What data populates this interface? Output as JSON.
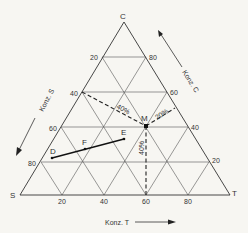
{
  "diagram": {
    "vertices": {
      "C": "C",
      "S": "S",
      "T": "T"
    },
    "axis_labels": {
      "konz_s": "Konz. S",
      "konz_c": "Konz. C",
      "konz_t": "Konz. T"
    },
    "ticks_bottom": [
      "20",
      "40",
      "60",
      "80"
    ],
    "ticks_left": [
      "20",
      "40",
      "60",
      "80"
    ],
    "ticks_right": [
      "80",
      "60",
      "40",
      "20"
    ],
    "points": {
      "M": "M",
      "D": "D",
      "E": "E",
      "F": "F"
    },
    "annotations": {
      "s_pct": "40%",
      "c_pct": "20%",
      "t_pct": "40%"
    }
  }
}
